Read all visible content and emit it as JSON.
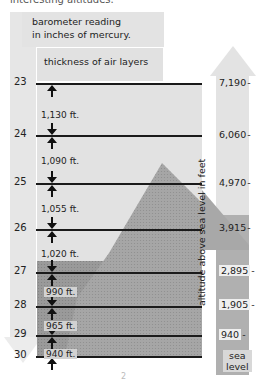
{
  "caption_fragment": "interesting altitudes.",
  "title": {
    "line1": "barometer reading",
    "line2": "in inches of mercury."
  },
  "subtitle": "thickness of air layers",
  "vertical_axis_label": "altitude above sea level in feet",
  "pressure_levels": [
    {
      "reading": "23",
      "altitude": "7,190"
    },
    {
      "reading": "24",
      "altitude": "6,060"
    },
    {
      "reading": "25",
      "altitude": "4,970"
    },
    {
      "reading": "26",
      "altitude": "3,915"
    },
    {
      "reading": "27",
      "altitude": "2,895"
    },
    {
      "reading": "28",
      "altitude": "1,905"
    },
    {
      "reading": "29",
      "altitude": "940"
    },
    {
      "reading": "30",
      "altitude": "sea level"
    }
  ],
  "layer_thickness": [
    {
      "between": "23-24",
      "label": "1,130 ft."
    },
    {
      "between": "24-25",
      "label": "1,090 ft."
    },
    {
      "between": "25-26",
      "label": "1,055 ft."
    },
    {
      "between": "26-27",
      "label": "1,020 ft."
    },
    {
      "between": "27-28",
      "label": "990 ft."
    },
    {
      "between": "28-29",
      "label": "965 ft."
    },
    {
      "between": "29-30",
      "label": "940 ft."
    }
  ],
  "sea_level_label": {
    "line1": "sea",
    "line2": "level"
  },
  "page_mark": "2",
  "colors": {
    "background": "#ffffff",
    "panel": "#e2e2e2",
    "mountain": "#a9a9a9",
    "lower_air": "#9c9c9c",
    "line": "#1a1a1a"
  }
}
